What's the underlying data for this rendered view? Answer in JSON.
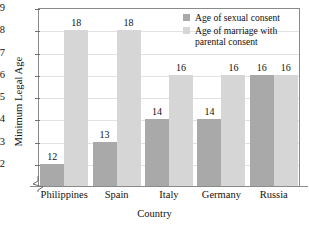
{
  "chart_data": {
    "type": "bar",
    "title": "",
    "subtitle": "",
    "xlabel": "Country",
    "ylabel": "Minimum Legal Age",
    "categories": [
      "Philippines",
      "Spain",
      "Italy",
      "Germany",
      "Russia"
    ],
    "series": [
      {
        "name": "Age of sexual consent",
        "color": "#a9a9a9",
        "values": [
          12,
          13,
          14,
          14,
          16
        ]
      },
      {
        "name": "Age of marriage with parental consent",
        "color": "#d6d6d6",
        "values": [
          18,
          18,
          16,
          16,
          16
        ]
      }
    ],
    "ylim": [
      11,
      19
    ],
    "yticks": [
      12,
      13,
      14,
      15,
      16,
      17,
      18,
      19
    ],
    "ytick_labels": [
      "12",
      "13",
      "14",
      "15",
      "16",
      "17",
      "18",
      "19"
    ],
    "grid": true,
    "axis_break": true,
    "legend_position": "top-right",
    "data_labels": [
      [
        "12",
        "18"
      ],
      [
        "13",
        "18"
      ],
      [
        "14",
        "16"
      ],
      [
        "14",
        "16"
      ],
      [
        "16",
        "16"
      ]
    ]
  },
  "legend": {
    "entries": [
      {
        "label": "Age of sexual consent"
      },
      {
        "label": "Age of marriage with parental consent"
      }
    ]
  }
}
